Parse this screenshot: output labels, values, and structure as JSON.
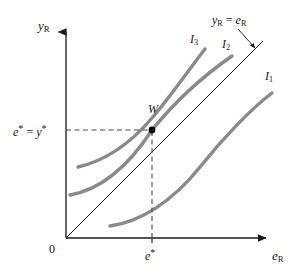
{
  "figure": {
    "background_color": "#ffffff",
    "curve_color": "#8a8a8a",
    "line_color": "#1a1a1a",
    "dash_color": "#4d4d4d",
    "point_color": "#000000"
  },
  "axes": {
    "y_label_main": "y",
    "y_label_sub": "R",
    "x_label_main": "e",
    "x_label_sub": "R",
    "origin_label": "0",
    "y_axis_x": 66,
    "x_axis_y": 238,
    "y_axis_top": 30,
    "x_axis_right": 268
  },
  "ticks": {
    "y_tick": {
      "label_left": "e",
      "label_star1": "*",
      "label_eq": " = ",
      "label_right": "y",
      "label_star2": "*",
      "y_px": 130
    },
    "x_tick": {
      "label_main": "e",
      "label_star": "*",
      "x_px": 152
    }
  },
  "diagonal": {
    "label_lhs": "y",
    "label_lhs_sub": "R",
    "label_eq": " = ",
    "label_rhs": "e",
    "label_rhs_sub": "R",
    "from": [
      66,
      238
    ],
    "to": [
      263,
      41
    ]
  },
  "point_w": {
    "label": "W",
    "x": 152,
    "y": 130
  },
  "curves": [
    {
      "id": "I3",
      "label_main": "I",
      "label_sub": "3",
      "order": "leftmost",
      "path": "M 78 167 C 104 161, 130 144, 152 118 C 172 95, 190 68, 205 49"
    },
    {
      "id": "I2",
      "label_main": "I",
      "label_sub": "2",
      "order": "middle",
      "path": "M 70 195 C 98 190, 126 170, 152 130 C 178 98, 206 74, 232 56"
    },
    {
      "id": "I1",
      "label_main": "I",
      "label_sub": "1",
      "order": "rightmost",
      "path": "M 110 226 C 140 222, 172 202, 200 167 C 224 137, 252 108, 272 93"
    }
  ],
  "guides": {
    "horizontal_dash": {
      "from": [
        66,
        130
      ],
      "to": [
        152,
        130
      ]
    },
    "vertical_dash": {
      "from": [
        152,
        130
      ],
      "to": [
        152,
        238
      ]
    }
  },
  "leader": {
    "from": [
      240,
      30
    ],
    "to": [
      256,
      49
    ]
  }
}
